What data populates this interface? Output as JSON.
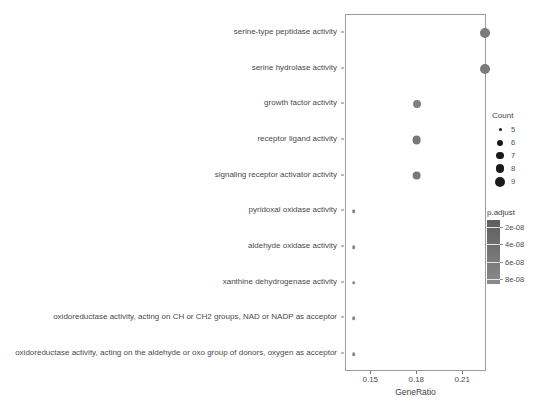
{
  "chart_data": {
    "type": "scatter",
    "plot_style": "dotplot",
    "title": "",
    "xlabel": "GeneRatio",
    "ylabel": "",
    "xticks": [
      0.15,
      0.18,
      0.21
    ],
    "xticklabels": [
      "0.15",
      "0.18",
      "0.21"
    ],
    "xlim": [
      0.1335,
      0.2255
    ],
    "grid": false,
    "legends": [
      {
        "name": "size",
        "title": "Count",
        "position": "right-top",
        "entries": [
          {
            "label": "5",
            "value": 5,
            "dot_px": 3.0
          },
          {
            "label": "6",
            "value": 6,
            "dot_px": 6.0
          },
          {
            "label": "7",
            "value": 7,
            "dot_px": 7.4
          },
          {
            "label": "8",
            "value": 8,
            "dot_px": 8.6
          },
          {
            "label": "9",
            "value": 9,
            "dot_px": 10.0
          }
        ]
      },
      {
        "name": "color",
        "title": "p.adjust",
        "position": "right-bottom",
        "ticks": [
          "2e-08",
          "4e-08",
          "6e-08",
          "8e-08"
        ],
        "tick_values": [
          2e-08,
          4e-08,
          6e-08,
          8e-08
        ],
        "range": [
          1.2e-08,
          8.6e-08
        ],
        "colors_low": "#5e5e5e",
        "colors_high": "#8b8b8b"
      }
    ],
    "categories": [
      "serine-type peptidase activity",
      "serine hydrolase activity",
      "growth factor activity",
      "receptor ligand activity",
      "signaling receptor activator activity",
      "pyridoxal oxidase activity",
      "aldehyde oxidase activity",
      "xanthine dehydrogenase activity",
      "oxidoreductase activity, acting on CH or CH2 groups, NAD or NADP as acceptor",
      "oxidoreductase activity, acting on the aldehyde or oxo group of donors, oxygen as acceptor"
    ],
    "points": [
      {
        "term": "serine-type peptidase activity",
        "gene_ratio": 0.2245,
        "count": 9,
        "p_adjust": 4.4e-08,
        "color": "#7b7b7b",
        "dot_px": 10.0
      },
      {
        "term": "serine hydrolase activity",
        "gene_ratio": 0.2245,
        "count": 9,
        "p_adjust": 4.4e-08,
        "color": "#7b7b7b",
        "dot_px": 10.0
      },
      {
        "term": "growth factor activity",
        "gene_ratio": 0.1795,
        "count": 7,
        "p_adjust": 5.2e-08,
        "color": "#808080",
        "dot_px": 8.0
      },
      {
        "term": "receptor ligand activity",
        "gene_ratio": 0.1795,
        "count": 8,
        "p_adjust": 4e-08,
        "color": "#787878",
        "dot_px": 8.8
      },
      {
        "term": "signaling receptor activator activity",
        "gene_ratio": 0.1795,
        "count": 8,
        "p_adjust": 4e-08,
        "color": "#787878",
        "dot_px": 8.8
      },
      {
        "term": "pyridoxal oxidase activity",
        "gene_ratio": 0.1385,
        "count": 5,
        "p_adjust": 7.8e-08,
        "color": "#888888",
        "dot_px": 3.6
      },
      {
        "term": "aldehyde oxidase activity",
        "gene_ratio": 0.1385,
        "count": 5,
        "p_adjust": 7.8e-08,
        "color": "#888888",
        "dot_px": 3.6
      },
      {
        "term": "xanthine dehydrogenase activity",
        "gene_ratio": 0.1385,
        "count": 5,
        "p_adjust": 7.8e-08,
        "color": "#888888",
        "dot_px": 3.6
      },
      {
        "term": "oxidoreductase activity, acting on CH or CH2 groups, NAD or NADP as acceptor",
        "gene_ratio": 0.1385,
        "count": 5,
        "p_adjust": 7.8e-08,
        "color": "#888888",
        "dot_px": 3.6
      },
      {
        "term": "oxidoreductase activity, acting on the aldehyde or oxo group of donors, oxygen as acceptor",
        "gene_ratio": 0.1385,
        "count": 5,
        "p_adjust": 7.8e-08,
        "color": "#888888",
        "dot_px": 3.6
      }
    ]
  }
}
